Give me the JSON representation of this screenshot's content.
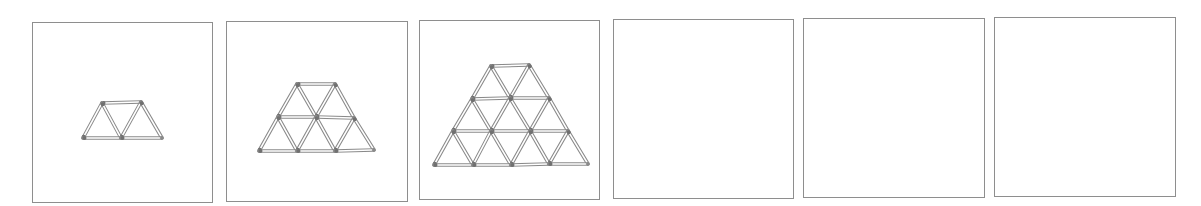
{
  "colors": {
    "border": "#8e8e8e",
    "stick_outline": "#8a8a8a",
    "stick_head": "#707070",
    "background": "#ffffff"
  },
  "panels": [
    {
      "index": 1,
      "box": {
        "x": 32,
        "y": 22,
        "w": 181,
        "h": 181
      },
      "rows": 1,
      "triangles": 3,
      "vertices": [
        [
          [
            102,
            103
          ],
          [
            141,
            102
          ]
        ],
        [
          [
            83,
            138
          ],
          [
            121,
            138
          ],
          [
            162,
            138
          ]
        ]
      ]
    },
    {
      "index": 2,
      "box": {
        "x": 226,
        "y": 21,
        "w": 182,
        "h": 181
      },
      "rows": 2,
      "triangles": 8,
      "vertices": [
        [
          [
            297,
            84
          ],
          [
            335,
            84
          ]
        ],
        [
          [
            278,
            117
          ],
          [
            316,
            117
          ],
          [
            354,
            118
          ]
        ],
        [
          [
            259,
            151
          ],
          [
            297,
            151
          ],
          [
            335,
            151
          ],
          [
            374,
            150
          ]
        ]
      ]
    },
    {
      "index": 3,
      "box": {
        "x": 419,
        "y": 20,
        "w": 181,
        "h": 180
      },
      "rows": 3,
      "triangles": 15,
      "vertices": [
        [
          [
            491,
            66
          ],
          [
            529,
            65
          ]
        ],
        [
          [
            472,
            99
          ],
          [
            510,
            98
          ],
          [
            549,
            98
          ]
        ],
        [
          [
            453,
            131
          ],
          [
            491,
            131
          ],
          [
            530,
            131
          ],
          [
            568,
            131
          ]
        ],
        [
          [
            434,
            165
          ],
          [
            473,
            165
          ],
          [
            511,
            165
          ],
          [
            549,
            164
          ],
          [
            588,
            164
          ]
        ]
      ]
    },
    {
      "index": 4,
      "box": {
        "x": 613,
        "y": 19,
        "w": 181,
        "h": 180
      },
      "rows": 0,
      "triangles": 0,
      "vertices": []
    },
    {
      "index": 5,
      "box": {
        "x": 803,
        "y": 18,
        "w": 182,
        "h": 180
      },
      "rows": 0,
      "triangles": 0,
      "vertices": []
    },
    {
      "index": 6,
      "box": {
        "x": 994,
        "y": 17,
        "w": 182,
        "h": 180
      },
      "rows": 0,
      "triangles": 0,
      "vertices": []
    }
  ]
}
